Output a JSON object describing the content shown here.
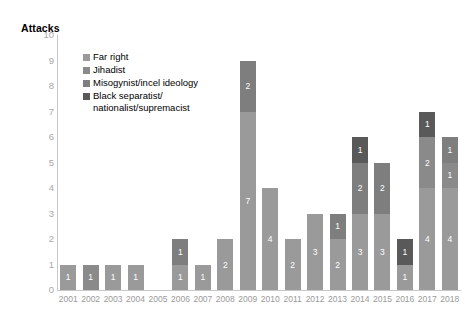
{
  "chart_data": {
    "type": "bar",
    "subtype": "stacked-bar",
    "title": "",
    "ylabel": "Attacks",
    "xlabel": "",
    "ylim": [
      0,
      10
    ],
    "ytick_step": 1,
    "yticks": [
      "10",
      "9",
      "8",
      "7",
      "6",
      "5",
      "4",
      "3",
      "2",
      "1",
      "0"
    ],
    "grid": false,
    "legend_position": "inside-top-left",
    "categories": [
      "2001",
      "2002",
      "2003",
      "2004",
      "2005",
      "2006",
      "2007",
      "2008",
      "2009",
      "2010",
      "2011",
      "2012",
      "2013",
      "2014",
      "2015",
      "2016",
      "2017",
      "2018"
    ],
    "series": [
      {
        "name": "Far right",
        "color": "#9a9a9a",
        "values": [
          1,
          0,
          1,
          1,
          0,
          1,
          1,
          2,
          7,
          4,
          2,
          3,
          2,
          3,
          3,
          1,
          4,
          4
        ]
      },
      {
        "name": "Jihadist",
        "color": "#8a8a8a",
        "values": [
          0,
          1,
          0,
          0,
          0,
          0,
          0,
          0,
          0,
          0,
          0,
          0,
          0,
          0,
          0,
          0,
          2,
          1
        ]
      },
      {
        "name": "Misogynist/incel ideology",
        "color": "#7e7e7e",
        "values": [
          0,
          0,
          0,
          0,
          0,
          1,
          0,
          0,
          2,
          0,
          0,
          0,
          1,
          2,
          2,
          0,
          0,
          1
        ]
      },
      {
        "name": "Black separatist/\nnationalist/supremacist",
        "color": "#595959",
        "values": [
          0,
          0,
          0,
          0,
          0,
          0,
          0,
          0,
          0,
          0,
          0,
          0,
          0,
          1,
          0,
          1,
          1,
          0
        ]
      }
    ],
    "totals": [
      1,
      1,
      1,
      1,
      0,
      2,
      1,
      2,
      9,
      4,
      2,
      3,
      3,
      6,
      5,
      2,
      7,
      6
    ],
    "bar_stacks": [
      {
        "year": "2001",
        "segments": [
          {
            "series": "Far right",
            "value": 1,
            "label": "1"
          }
        ]
      },
      {
        "year": "2002",
        "segments": [
          {
            "series": "Jihadist",
            "value": 1,
            "label": "1"
          }
        ]
      },
      {
        "year": "2003",
        "segments": [
          {
            "series": "Far right",
            "value": 1,
            "label": "1"
          }
        ]
      },
      {
        "year": "2004",
        "segments": [
          {
            "series": "Far right",
            "value": 1,
            "label": "1"
          }
        ]
      },
      {
        "year": "2005",
        "segments": []
      },
      {
        "year": "2006",
        "segments": [
          {
            "series": "Far right",
            "value": 1,
            "label": "1"
          },
          {
            "series": "Misogynist/incel ideology",
            "value": 1,
            "label": "1"
          }
        ]
      },
      {
        "year": "2007",
        "segments": [
          {
            "series": "Far right",
            "value": 1,
            "label": "1"
          }
        ]
      },
      {
        "year": "2008",
        "segments": [
          {
            "series": "Far right",
            "value": 2,
            "label": "2"
          }
        ]
      },
      {
        "year": "2009",
        "segments": [
          {
            "series": "Far right",
            "value": 7,
            "label": "7"
          },
          {
            "series": "Misogynist/incel ideology",
            "value": 2,
            "label": "2"
          }
        ]
      },
      {
        "year": "2010",
        "segments": [
          {
            "series": "Far right",
            "value": 4,
            "label": "4"
          }
        ]
      },
      {
        "year": "2011",
        "segments": [
          {
            "series": "Far right",
            "value": 2,
            "label": "2"
          }
        ]
      },
      {
        "year": "2012",
        "segments": [
          {
            "series": "Far right",
            "value": 3,
            "label": "3"
          }
        ]
      },
      {
        "year": "2013",
        "segments": [
          {
            "series": "Far right",
            "value": 2,
            "label": "2"
          },
          {
            "series": "Misogynist/incel ideology",
            "value": 1,
            "label": "1"
          }
        ]
      },
      {
        "year": "2014",
        "segments": [
          {
            "series": "Far right",
            "value": 3,
            "label": "3"
          },
          {
            "series": "Misogynist/incel ideology",
            "value": 2,
            "label": "2"
          },
          {
            "series": "Black separatist/nationalist/supremacist",
            "value": 1,
            "label": "1"
          }
        ]
      },
      {
        "year": "2015",
        "segments": [
          {
            "series": "Far right",
            "value": 3,
            "label": "3"
          },
          {
            "series": "Misogynist/incel ideology",
            "value": 2,
            "label": "2"
          }
        ]
      },
      {
        "year": "2016",
        "segments": [
          {
            "series": "Far right",
            "value": 1,
            "label": "1"
          },
          {
            "series": "Black separatist/nationalist/supremacist",
            "value": 1,
            "label": "1"
          }
        ]
      },
      {
        "year": "2017",
        "segments": [
          {
            "series": "Far right",
            "value": 4,
            "label": "4"
          },
          {
            "series": "Jihadist",
            "value": 2,
            "label": "2"
          },
          {
            "series": "Black separatist/nationalist/supremacist",
            "value": 1,
            "label": "1"
          }
        ]
      },
      {
        "year": "2018",
        "segments": [
          {
            "series": "Far right",
            "value": 4,
            "label": "4"
          },
          {
            "series": "Jihadist",
            "value": 1,
            "label": "1"
          },
          {
            "series": "Misogynist/incel ideology",
            "value": 1,
            "label": "1"
          }
        ]
      }
    ]
  },
  "legend": {
    "items": [
      {
        "label": "Far right",
        "color": "#9a9a9a"
      },
      {
        "label": "Jihadist",
        "color": "#8a8a8a"
      },
      {
        "label": "Misogynist/incel ideology",
        "color": "#7e7e7e"
      },
      {
        "label": "Black separatist/\nnationalist/supremacist",
        "color": "#595959"
      }
    ]
  },
  "axes": {
    "y_title": "Attacks",
    "y_tick_color": "#a8a8a8",
    "x_tick_color": "#9a9a9a",
    "axis_line_color": "#c8c8c8"
  }
}
